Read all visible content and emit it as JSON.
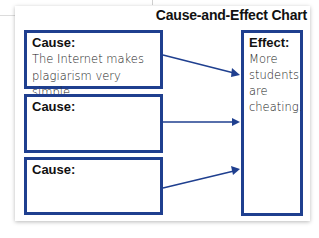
{
  "title": "Cause-and-Effect Chart",
  "causes": [
    {
      "label": "Cause:",
      "text_lines": [
        "The Internet makes",
        "plagiarism very simple."
      ]
    },
    {
      "label": "Cause:",
      "text_lines": []
    },
    {
      "label": "Cause:",
      "text_lines": []
    }
  ],
  "effect": {
    "label": "Effect:",
    "text_lines": [
      "More",
      "students",
      "are",
      "cheating."
    ]
  },
  "colors": {
    "border": "#1f3f8f",
    "arrow": "#1f3f8f"
  }
}
